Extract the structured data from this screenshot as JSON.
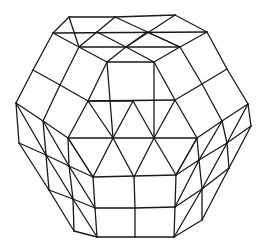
{
  "figure": {
    "type": "polyhedron-wireframe",
    "stroke_color": "#1a1a1a",
    "background": "#ffffff",
    "vertices": {
      "T1": [
        69,
        17
      ],
      "T2": [
        115,
        17
      ],
      "T3": [
        175,
        15
      ],
      "R1a": [
        53,
        33
      ],
      "R1b": [
        97,
        32
      ],
      "R1c": [
        147,
        32
      ],
      "R1d": [
        207,
        32
      ],
      "R2a": [
        79,
        47
      ],
      "R2b": [
        126,
        47
      ],
      "R2c": [
        180,
        47
      ],
      "P1": [
        107,
        62
      ],
      "P2": [
        154,
        62
      ],
      "L1": [
        33,
        70
      ],
      "L2": [
        60,
        85
      ],
      "L3": [
        16,
        103
      ],
      "L4": [
        43,
        121
      ],
      "G1": [
        88,
        101
      ],
      "G2": [
        133,
        101
      ],
      "G3": [
        175,
        100
      ],
      "G4": [
        68,
        138
      ],
      "G5": [
        113,
        138
      ],
      "G6": [
        154,
        138
      ],
      "G7": [
        197,
        138
      ],
      "G8": [
        93,
        177
      ],
      "G9": [
        134,
        177
      ],
      "G10": [
        176,
        175
      ],
      "Ra": [
        227,
        69
      ],
      "Rb": [
        202,
        84
      ],
      "Rc": [
        248,
        104
      ],
      "Rd": [
        222,
        121
      ],
      "Re": [
        251,
        126
      ],
      "Rf": [
        227,
        143
      ],
      "Rg": [
        199,
        160
      ],
      "Rh": [
        229,
        168
      ],
      "Ri": [
        202,
        189
      ],
      "Rj": [
        202,
        220
      ],
      "LL1": [
        19,
        143
      ],
      "LL2": [
        46,
        155
      ],
      "LL3": [
        69,
        166
      ],
      "LL4": [
        49,
        190
      ],
      "LL5": [
        73,
        199
      ],
      "LL6": [
        74,
        231
      ],
      "B1": [
        95,
        208
      ],
      "B2": [
        135,
        208
      ],
      "B3": [
        175,
        207
      ],
      "B4": [
        97,
        237
      ],
      "B5": [
        135,
        237
      ],
      "B6": [
        174,
        237
      ]
    },
    "edges": [
      [
        "T1",
        "T2"
      ],
      [
        "T2",
        "T3"
      ],
      [
        "T1",
        "R1a"
      ],
      [
        "T3",
        "R1d"
      ],
      [
        "R1a",
        "R1d"
      ],
      [
        "T1",
        "R2a"
      ],
      [
        "T2",
        "R1b"
      ],
      [
        "R1b",
        "R2a"
      ],
      [
        "T2",
        "R2c"
      ],
      [
        "T3",
        "R2b"
      ],
      [
        "R1a",
        "R2a"
      ],
      [
        "R2a",
        "R2c"
      ],
      [
        "R2c",
        "R1d"
      ],
      [
        "R2a",
        "P1"
      ],
      [
        "R1b",
        "R2b"
      ],
      [
        "R2b",
        "P2"
      ],
      [
        "R1c",
        "R2c"
      ],
      [
        "R1c",
        "R2b"
      ],
      [
        "R2b",
        "P1"
      ],
      [
        "P1",
        "P2"
      ],
      [
        "R2c",
        "P2"
      ],
      [
        "R1a",
        "L1"
      ],
      [
        "L1",
        "L3"
      ],
      [
        "R2a",
        "L2"
      ],
      [
        "L1",
        "L2"
      ],
      [
        "L2",
        "G1"
      ],
      [
        "L2",
        "L4"
      ],
      [
        "L3",
        "L4"
      ],
      [
        "L4",
        "G4"
      ],
      [
        "P1",
        "G1"
      ],
      [
        "G1",
        "G4"
      ],
      [
        "P2",
        "G3"
      ],
      [
        "R1d",
        "Ra"
      ],
      [
        "Ra",
        "Rc"
      ],
      [
        "R2c",
        "Rb"
      ],
      [
        "Ra",
        "Rb"
      ],
      [
        "Rb",
        "G3"
      ],
      [
        "Rb",
        "Rd"
      ],
      [
        "Rc",
        "Rd"
      ],
      [
        "Rd",
        "G7"
      ],
      [
        "G3",
        "G7"
      ],
      [
        "G1",
        "G3"
      ],
      [
        "G1",
        "G5"
      ],
      [
        "P1",
        "G5"
      ],
      [
        "G5",
        "G2"
      ],
      [
        "G2",
        "G6"
      ],
      [
        "G6",
        "P2"
      ],
      [
        "G2",
        "G1"
      ],
      [
        "G6",
        "G3"
      ],
      [
        "G4",
        "G7"
      ],
      [
        "G4",
        "G8"
      ],
      [
        "G8",
        "G5"
      ],
      [
        "G5",
        "G9"
      ],
      [
        "G9",
        "G6"
      ],
      [
        "G6",
        "G10"
      ],
      [
        "G10",
        "G7"
      ],
      [
        "G8",
        "G10"
      ],
      [
        "L3",
        "LL1"
      ],
      [
        "L3",
        "LL2"
      ],
      [
        "L4",
        "LL2"
      ],
      [
        "L4",
        "LL3"
      ],
      [
        "G4",
        "LL3"
      ],
      [
        "G4",
        "G8"
      ],
      [
        "LL1",
        "LL2"
      ],
      [
        "LL2",
        "LL3"
      ],
      [
        "LL3",
        "G8"
      ],
      [
        "LL1",
        "LL4"
      ],
      [
        "LL2",
        "LL4"
      ],
      [
        "LL2",
        "LL5"
      ],
      [
        "LL3",
        "LL5"
      ],
      [
        "LL3",
        "B1"
      ],
      [
        "G8",
        "B1"
      ],
      [
        "LL4",
        "LL5"
      ],
      [
        "LL5",
        "B1"
      ],
      [
        "LL4",
        "LL6"
      ],
      [
        "LL5",
        "LL6"
      ],
      [
        "LL5",
        "B4"
      ],
      [
        "B1",
        "B4"
      ],
      [
        "LL6",
        "B4"
      ],
      [
        "Rc",
        "Re"
      ],
      [
        "Rc",
        "Rf"
      ],
      [
        "Rd",
        "Rf"
      ],
      [
        "Rd",
        "Rg"
      ],
      [
        "G7",
        "Rg"
      ],
      [
        "G7",
        "G10"
      ],
      [
        "Re",
        "Rf"
      ],
      [
        "Rf",
        "Rg"
      ],
      [
        "Rg",
        "G10"
      ],
      [
        "Re",
        "Rh"
      ],
      [
        "Rf",
        "Rh"
      ],
      [
        "Rf",
        "Ri"
      ],
      [
        "Rg",
        "Ri"
      ],
      [
        "Rg",
        "B3"
      ],
      [
        "G10",
        "B3"
      ],
      [
        "Rh",
        "Ri"
      ],
      [
        "Ri",
        "B3"
      ],
      [
        "Rh",
        "Rj"
      ],
      [
        "Ri",
        "Rj"
      ],
      [
        "Ri",
        "B6"
      ],
      [
        "B3",
        "B6"
      ],
      [
        "Rj",
        "B6"
      ],
      [
        "G9",
        "B2"
      ],
      [
        "B1",
        "B2"
      ],
      [
        "B2",
        "B3"
      ],
      [
        "B2",
        "B5"
      ],
      [
        "B4",
        "B5"
      ],
      [
        "B5",
        "B6"
      ]
    ]
  }
}
